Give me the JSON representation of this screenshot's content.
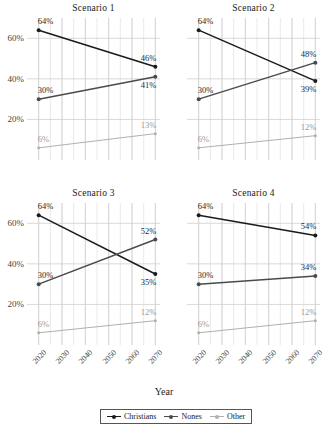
{
  "chart_data": {
    "type": "line",
    "title": "",
    "xlabel": "Year",
    "ylabel": "",
    "x": [
      2020,
      2070
    ],
    "xlim": [
      2015,
      2072
    ],
    "ylim": [
      0,
      70
    ],
    "yticks": [
      20,
      40,
      60
    ],
    "ytick_labels": [
      "20%",
      "40%",
      "60%"
    ],
    "xticks": [
      2020,
      2030,
      2040,
      2050,
      2060,
      2070
    ],
    "xtick_labels": [
      "2020",
      "2030",
      "2040",
      "2050",
      "2060",
      "2070"
    ],
    "grid": true,
    "legend_position": "bottom",
    "legend_entries": [
      "Christians",
      "Nones",
      "Other"
    ],
    "series_colors": {
      "Christians": "#1a1a1a",
      "Nones": "#4a4a4a",
      "Other": "#b0b0b0"
    },
    "panels": [
      {
        "title": "Scenario 1",
        "series": [
          {
            "name": "Christians",
            "values": [
              64,
              46
            ],
            "labels": [
              "64%",
              "46%"
            ]
          },
          {
            "name": "Nones",
            "values": [
              30,
              41
            ],
            "labels": [
              "30%",
              "41%"
            ]
          },
          {
            "name": "Other",
            "values": [
              6,
              13
            ],
            "labels": [
              "6%",
              "13%"
            ]
          }
        ]
      },
      {
        "title": "Scenario 2",
        "series": [
          {
            "name": "Christians",
            "values": [
              64,
              39
            ],
            "labels": [
              "64%",
              "39%"
            ]
          },
          {
            "name": "Nones",
            "values": [
              30,
              48
            ],
            "labels": [
              "30%",
              "48%"
            ]
          },
          {
            "name": "Other",
            "values": [
              6,
              12
            ],
            "labels": [
              "6%",
              "12%"
            ]
          }
        ]
      },
      {
        "title": "Scenario 3",
        "series": [
          {
            "name": "Christians",
            "values": [
              64,
              35
            ],
            "labels": [
              "64%",
              "35%"
            ]
          },
          {
            "name": "Nones",
            "values": [
              30,
              52
            ],
            "labels": [
              "30%",
              "52%"
            ]
          },
          {
            "name": "Other",
            "values": [
              6,
              12
            ],
            "labels": [
              "6%",
              "12%"
            ]
          }
        ]
      },
      {
        "title": "Scenario 4",
        "series": [
          {
            "name": "Christians",
            "values": [
              64,
              54
            ],
            "labels": [
              "64%",
              "54%"
            ]
          },
          {
            "name": "Nones",
            "values": [
              30,
              34
            ],
            "labels": [
              "30%",
              "34%"
            ]
          },
          {
            "name": "Other",
            "values": [
              6,
              12
            ],
            "labels": [
              "6%",
              "12%"
            ]
          }
        ]
      }
    ]
  },
  "legend": {
    "items": [
      {
        "label": "Christians",
        "color": "#1a1a1a"
      },
      {
        "label": "Nones",
        "color": "#4a4a4a"
      },
      {
        "label": "Other",
        "color": "#b0b0b0"
      }
    ]
  },
  "axis": {
    "x_title": "Year"
  }
}
